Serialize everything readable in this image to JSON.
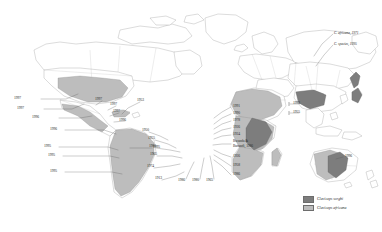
{
  "figure": {
    "type": "world-distribution-map",
    "background_color": "#ffffff",
    "land_outline_color": "#9a9a9a",
    "leader_line_color": "#555555"
  },
  "legend": {
    "position": "bottom-right",
    "items": [
      {
        "key": "sorghi",
        "label": "Claviceps sorghi",
        "color": "#7d7d7d",
        "style": "italic"
      },
      {
        "key": "africana",
        "label": "Claviceps africana",
        "color": "#bdbdbd",
        "style": "italic"
      }
    ]
  },
  "labels": {
    "north_america": [
      {
        "id": "na-1",
        "text": "1997",
        "x": 30,
        "y": 98,
        "align": "right"
      },
      {
        "id": "na-2",
        "text": "1997",
        "x": 33,
        "y": 108,
        "align": "right"
      },
      {
        "id": "na-3",
        "text": "1996",
        "x": 48,
        "y": 117,
        "align": "right"
      }
    ],
    "caribbean_central_america": [
      {
        "id": "ca-1",
        "text": "1997",
        "x": 103,
        "y": 100,
        "align": "left"
      },
      {
        "id": "ca-2",
        "text": "1997",
        "x": 117,
        "y": 105,
        "align": "left"
      },
      {
        "id": "ca-3",
        "text": "1997",
        "x": 120,
        "y": 112,
        "align": "left"
      },
      {
        "id": "ca-4",
        "text": "1996",
        "x": 126,
        "y": 120,
        "align": "left"
      },
      {
        "id": "ca-5",
        "text": "1953",
        "x": 141,
        "y": 101,
        "align": "left"
      }
    ],
    "south_america": [
      {
        "id": "sa-1",
        "text": "1996",
        "x": 66,
        "y": 129,
        "align": "right"
      },
      {
        "id": "sa-2",
        "text": "1995",
        "x": 60,
        "y": 146,
        "align": "right"
      },
      {
        "id": "sa-3",
        "text": "1995",
        "x": 64,
        "y": 155,
        "align": "right"
      },
      {
        "id": "sa-4",
        "text": "1995",
        "x": 66,
        "y": 171,
        "align": "right"
      },
      {
        "id": "sa-5",
        "text": "1995",
        "x": 131,
        "y": 147,
        "align": "left"
      }
    ],
    "west_africa": [
      {
        "id": "wa-1",
        "text": "1950",
        "x": 150,
        "y": 131,
        "align": "left"
      },
      {
        "id": "wa-2",
        "text": "1955",
        "x": 156,
        "y": 139,
        "align": "left"
      },
      {
        "id": "wa-3",
        "text": "1986",
        "x": 157,
        "y": 147,
        "align": "left"
      },
      {
        "id": "wa-4",
        "text": "1965",
        "x": 158,
        "y": 155,
        "align": "left"
      },
      {
        "id": "wa-5",
        "text": "1974",
        "x": 155,
        "y": 167,
        "align": "left"
      },
      {
        "id": "wa-6",
        "text": "1913",
        "x": 163,
        "y": 179,
        "align": "left"
      }
    ],
    "central_south_africa": [
      {
        "id": "sf-1",
        "text": "1986",
        "x": 182,
        "y": 180,
        "align": "left"
      },
      {
        "id": "sf-2",
        "text": "1980",
        "x": 196,
        "y": 180,
        "align": "left"
      },
      {
        "id": "sf-3",
        "text": "1965",
        "x": 210,
        "y": 180,
        "align": "left"
      }
    ],
    "east_africa": [
      {
        "id": "ea-1",
        "text": "1991",
        "x": 232,
        "y": 106,
        "align": "left"
      },
      {
        "id": "ea-2",
        "text": "1990",
        "x": 232,
        "y": 113,
        "align": "left"
      },
      {
        "id": "ea-3",
        "text": "1978",
        "x": 232,
        "y": 120,
        "align": "left"
      },
      {
        "id": "ea-4",
        "text": "1926",
        "x": 232,
        "y": 127,
        "align": "left"
      },
      {
        "id": "ea-5",
        "text": "1924",
        "x": 232,
        "y": 134,
        "align": "left"
      },
      {
        "id": "ea-6",
        "text": "Rwanda &",
        "x": 232,
        "y": 142,
        "align": "left"
      },
      {
        "id": "ea-7",
        "text": "Burundi, 1986",
        "x": 232,
        "y": 147,
        "align": "left"
      },
      {
        "id": "ea-8",
        "text": "1926",
        "x": 232,
        "y": 156,
        "align": "left"
      },
      {
        "id": "ea-9",
        "text": "1958",
        "x": 232,
        "y": 165,
        "align": "left"
      },
      {
        "id": "ea-10",
        "text": "1986",
        "x": 232,
        "y": 174,
        "align": "left"
      }
    ],
    "asia": [
      {
        "id": "as-1",
        "text": "1993",
        "x": 300,
        "y": 103,
        "align": "left"
      },
      {
        "id": "as-2",
        "text": "1955",
        "x": 300,
        "y": 112,
        "align": "left"
      }
    ],
    "east_asia_species": [
      {
        "id": "jp-1",
        "text": "C. africana, 1971",
        "x": 334,
        "y": 33,
        "align": "left",
        "italic": true
      },
      {
        "id": "jp-2",
        "text": "C. species, 1995",
        "x": 334,
        "y": 44,
        "align": "left",
        "italic": true
      }
    ],
    "oceania": [
      {
        "id": "oc-1",
        "text": "1996",
        "x": 344,
        "y": 156,
        "align": "left"
      }
    ]
  }
}
